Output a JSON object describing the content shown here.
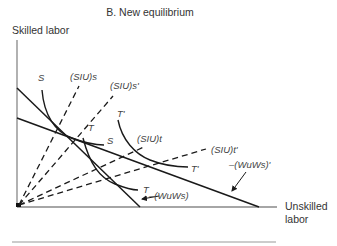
{
  "title": "B. New equilibrium",
  "axes": {
    "y_label": "Skilled labor",
    "x_label_line1": "Unskilled",
    "x_label_line2": "labor"
  },
  "curve_labels": {
    "S_top": "S",
    "S_right": "S",
    "T_top": "T",
    "T_bottom": "T",
    "Tprime_top": "T'",
    "Tprime_right": "T'"
  },
  "ray_labels": {
    "SIUs": "(SIU)s",
    "SIUs_prime": "(SIU)s'",
    "SIUt": "(SIU)t",
    "SIUt_prime": "(SIU)t'"
  },
  "budget_labels": {
    "WuWs": "–(WuWs)",
    "WuWs_prime": "–(WuWs)'"
  },
  "colors": {
    "line": "#1a1a1a",
    "axis": "#888888",
    "text": "#333333"
  }
}
